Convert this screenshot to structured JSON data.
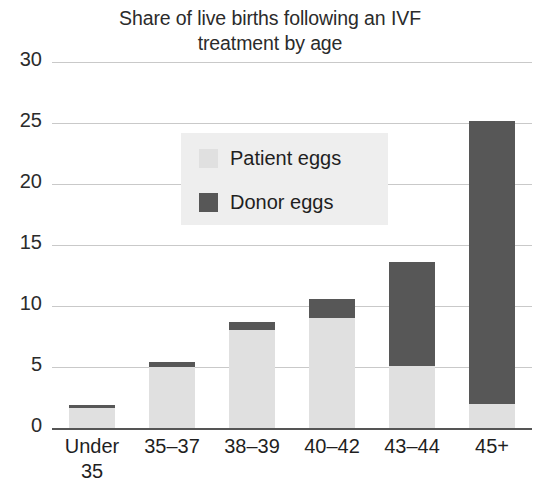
{
  "chart_data": {
    "type": "bar",
    "title": "Share of live births following an IVF\ntreatment by age",
    "xlabel": "",
    "ylabel": "",
    "ylim": [
      0,
      30
    ],
    "ytick_step": 5,
    "grid": true,
    "stacked": true,
    "legend_position": "inside-upper-left",
    "categories": [
      "Under\n35",
      "35–37",
      "38–39",
      "40–42",
      "43–44",
      "45+"
    ],
    "ytick_labels": [
      "0",
      "5",
      "10",
      "15",
      "20",
      "25",
      "30"
    ],
    "ytick_values": [
      0,
      5,
      10,
      15,
      20,
      25,
      30
    ],
    "series": [
      {
        "name": "Patient eggs",
        "color": "#e0e0e0",
        "values": [
          1.6,
          5.0,
          8.0,
          9.0,
          5.1,
          2.0
        ]
      },
      {
        "name": "Donor eggs",
        "color": "#575757",
        "values": [
          0.3,
          0.4,
          0.7,
          1.6,
          8.5,
          23.2
        ]
      }
    ],
    "totals": [
      1.9,
      5.4,
      8.7,
      10.6,
      13.6,
      25.2
    ]
  },
  "legend": {
    "items": [
      {
        "label": "Patient eggs",
        "swatch": "light-gray-swatch"
      },
      {
        "label": "Donor eggs",
        "swatch": "dark-gray-swatch"
      }
    ]
  },
  "colors": {
    "patient_eggs": "#e0e0e0",
    "donor_eggs": "#575757",
    "gridline": "#c9c9c9",
    "axis": "#555555",
    "legend_background": "#eeeeee",
    "text": "#1f1f1f",
    "background": "#ffffff"
  }
}
